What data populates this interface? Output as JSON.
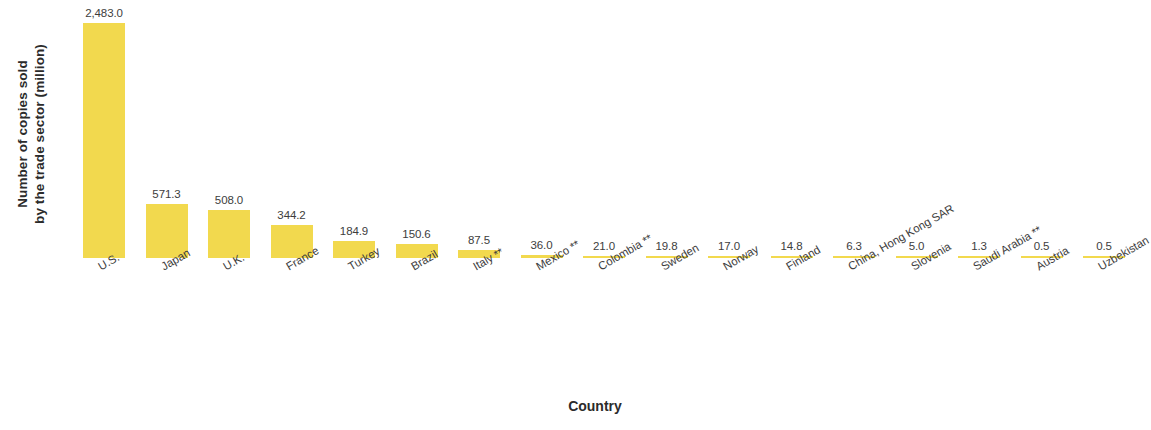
{
  "chart_data": {
    "type": "bar",
    "title": "",
    "xlabel": "Country",
    "ylabel": "Number of copies sold by the trade sector (million)",
    "ylabel_line1": "Number of copies sold",
    "ylabel_line2": "by the trade sector (million)",
    "ylim": [
      0,
      2483.0
    ],
    "grid": false,
    "legend": "none",
    "bar_color": "#f2d94e",
    "categories": [
      "U.S.",
      "Japan",
      "U.K.",
      "France",
      "Turkey",
      "Brazil",
      "Italy **",
      "Mexico **",
      "Colombia **",
      "Sweden",
      "Norway",
      "Finland",
      "China, Hong Kong SAR",
      "Slovenia",
      "Saudi Arabia **",
      "Austria",
      "Uzbekistan"
    ],
    "values": [
      2483.0,
      571.3,
      508.0,
      344.2,
      184.9,
      150.6,
      87.5,
      36.0,
      21.0,
      19.8,
      17.0,
      14.8,
      6.3,
      5.0,
      1.3,
      0.5,
      0.5
    ],
    "value_labels": [
      "2,483.0",
      "571.3",
      "508.0",
      "344.2",
      "184.9",
      "150.6",
      "87.5",
      "36.0",
      "21.0",
      "19.8",
      "17.0",
      "14.8",
      "6.3",
      "5.0",
      "1.3",
      "0.5",
      "0.5"
    ]
  }
}
